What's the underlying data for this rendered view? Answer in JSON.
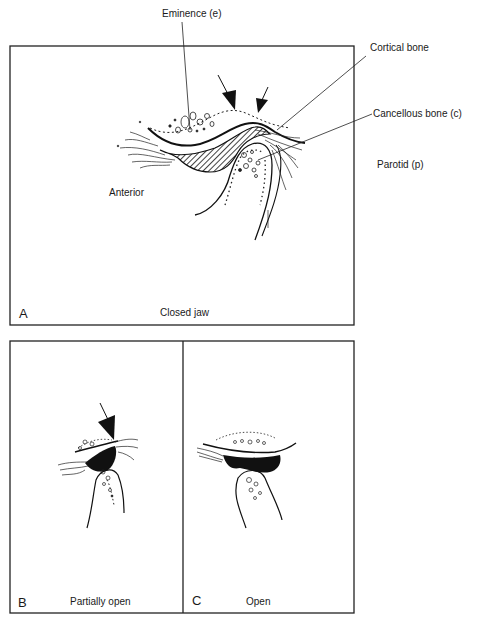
{
  "figure": {
    "panel_a": {
      "letter": "A",
      "caption": "Closed jaw",
      "labels": {
        "eminence": "Eminence (e)",
        "cortical": "Cortical bone",
        "cancellous": "Cancellous bone (c)",
        "parotid": "Parotid (p)",
        "anterior": "Anterior"
      }
    },
    "panel_b": {
      "letter": "B",
      "caption": "Partially open"
    },
    "panel_c": {
      "letter": "C",
      "caption": "Open"
    }
  }
}
